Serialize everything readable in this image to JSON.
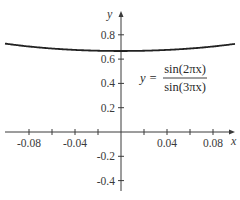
{
  "chart_data": {
    "type": "line",
    "title": "",
    "xlabel": "x",
    "ylabel": "y",
    "xlim": [
      -0.1,
      0.1
    ],
    "ylim": [
      -0.5,
      0.95
    ],
    "grid": false,
    "legend": null,
    "x_ticks": [
      -0.08,
      -0.06,
      -0.04,
      -0.02,
      0.02,
      0.04,
      0.06,
      0.08
    ],
    "x_tick_labels": [
      {
        "value": -0.08,
        "label": "-0.08"
      },
      {
        "value": -0.04,
        "label": "-0.04"
      },
      {
        "value": 0.04,
        "label": "0.04"
      },
      {
        "value": 0.08,
        "label": "0.08"
      }
    ],
    "y_ticks": [
      0.8,
      0.6,
      0.4,
      0.2,
      -0.2,
      -0.4
    ],
    "y_tick_labels": [
      {
        "value": 0.8,
        "label": "0.8"
      },
      {
        "value": 0.6,
        "label": "0.6"
      },
      {
        "value": 0.4,
        "label": "0.4"
      },
      {
        "value": 0.2,
        "label": "0.2"
      },
      {
        "value": -0.2,
        "label": "-0.2"
      },
      {
        "value": -0.4,
        "label": "-0.4"
      }
    ],
    "series": [
      {
        "name": "y = sin(2πx)/sin(3πx)",
        "function": "sin(2*pi*x)/sin(3*pi*x)",
        "x": [
          -0.1,
          -0.08,
          -0.06,
          -0.04,
          -0.02,
          0.0,
          0.02,
          0.04,
          0.06,
          0.08,
          0.1
        ],
        "values": [
          0.727,
          0.706,
          0.689,
          0.677,
          0.669,
          0.667,
          0.669,
          0.677,
          0.689,
          0.706,
          0.727
        ]
      }
    ],
    "annotations": [
      {
        "text": "y = sin(2πx) / sin(3πx)",
        "position": "right of y-axis, between 0.6 and 0.4"
      }
    ]
  },
  "labels": {
    "x_axis": "x",
    "y_axis": "y",
    "formula_lhs": "y =",
    "formula_numerator": "sin(2πx)",
    "formula_denominator": "sin(3πx)"
  }
}
